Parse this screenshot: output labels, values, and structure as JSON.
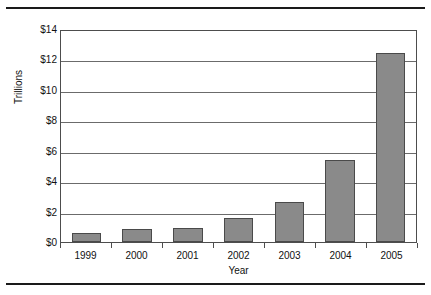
{
  "chart_data": {
    "type": "bar",
    "title": "",
    "subtitle": "",
    "xlabel": "Year",
    "ylabel": "Trillions",
    "categories": [
      "1999",
      "2000",
      "2001",
      "2002",
      "2003",
      "2004",
      "2005"
    ],
    "values": [
      0.6,
      0.85,
      0.9,
      1.6,
      2.65,
      5.4,
      12.4
    ],
    "series": [
      {
        "name": "Trillions",
        "values": [
          0.6,
          0.85,
          0.9,
          1.6,
          2.65,
          5.4,
          12.4
        ]
      }
    ],
    "ylim": [
      0,
      14
    ],
    "ytick_values": [
      0,
      2,
      4,
      6,
      8,
      10,
      12,
      14
    ],
    "ytick_labels": [
      "$0",
      "$2",
      "$4",
      "$6",
      "$8",
      "$10",
      "$12",
      "$14"
    ],
    "xtick_labels": [
      "1999",
      "2000",
      "2001",
      "2002",
      "2003",
      "2004",
      "2005"
    ],
    "grid": "horizontal",
    "legend": "none",
    "annotations": [],
    "colors": {
      "bar_fill": "#8a8a8a",
      "bar_border": "#4a4a4a",
      "gridline": "#6b6b6b",
      "axis": "#4d4d4d",
      "rule": "#1a1a1a",
      "text": "#111111",
      "background": "#ffffff"
    }
  }
}
